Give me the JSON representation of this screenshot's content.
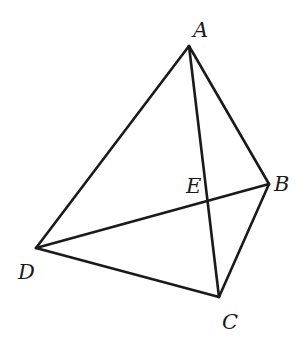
{
  "diagram": {
    "type": "tetrahedron",
    "stroke_color": "#1a1a1a",
    "points": {
      "A": {
        "x": 189,
        "y": 46
      },
      "B": {
        "x": 269,
        "y": 184
      },
      "C": {
        "x": 219,
        "y": 297
      },
      "D": {
        "x": 36,
        "y": 248
      },
      "E": {
        "x": 208,
        "y": 200
      }
    },
    "segments": [
      [
        "A",
        "B"
      ],
      [
        "A",
        "D"
      ],
      [
        "A",
        "C"
      ],
      [
        "B",
        "C"
      ],
      [
        "D",
        "C"
      ],
      [
        "D",
        "B"
      ]
    ],
    "labels": {
      "A": "A",
      "B": "B",
      "C": "C",
      "D": "D",
      "E": "E"
    }
  }
}
